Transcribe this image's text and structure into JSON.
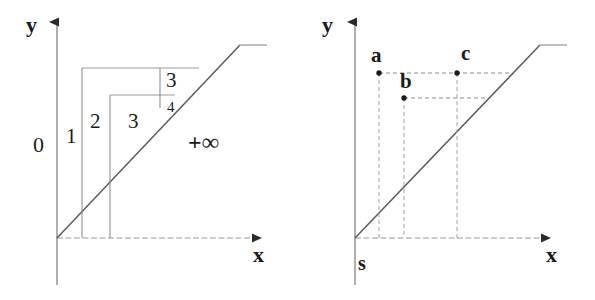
{
  "figure": {
    "title": "",
    "panels": [
      {
        "id": "left",
        "name": "scheduling-region-diagram",
        "axes": {
          "y_label": "y",
          "x_label": "x"
        },
        "labels": [
          {
            "text": "0",
            "x": 33,
            "y": 134,
            "role": "region-index"
          },
          {
            "text": "1",
            "x": 66,
            "y": 126,
            "role": "region-index"
          },
          {
            "text": "2",
            "x": 90,
            "y": 111,
            "role": "region-index"
          },
          {
            "text": "3",
            "x": 128,
            "y": 111,
            "role": "region-index"
          },
          {
            "text": "3",
            "x": 166,
            "y": 70,
            "role": "region-index"
          },
          {
            "text": "4",
            "x": 167,
            "y": 102,
            "role": "region-index-small"
          },
          {
            "text": "+∞",
            "x": 188,
            "y": 131,
            "role": "infinity-marker"
          }
        ],
        "geometry": {
          "origin": [
            57,
            238
          ],
          "y_axis_top": [
            57,
            18
          ],
          "x_axis_end": [
            266,
            238
          ],
          "diagonal": [
            [
              57,
              238
            ],
            [
              240,
              45
            ]
          ],
          "plateau": [
            [
              240,
              45
            ],
            [
              266,
              45
            ]
          ],
          "rect_outer": {
            "x": 82,
            "y": 68,
            "w": 98,
            "h": 170
          },
          "rect_inner": {
            "x": 110,
            "y": 95,
            "w": 52,
            "h": 143
          },
          "divider_vertical_x": 160,
          "divider_top_y": 68,
          "divider_bottom_y": 95
        }
      },
      {
        "id": "right",
        "name": "point-dominance-diagram",
        "axes": {
          "y_label": "y",
          "x_label": "x"
        },
        "labels": [
          {
            "text": "a",
            "x": 370,
            "y": 46,
            "role": "point-name"
          },
          {
            "text": "b",
            "x": 400,
            "y": 72,
            "role": "point-name"
          },
          {
            "text": "c",
            "x": 462,
            "y": 44,
            "role": "point-name"
          },
          {
            "text": "s",
            "x": 358,
            "y": 254,
            "role": "source-name"
          }
        ],
        "points": [
          {
            "name": "a",
            "x": 379,
            "y": 73
          },
          {
            "name": "b",
            "x": 404,
            "y": 98
          },
          {
            "name": "c",
            "x": 457,
            "y": 73
          }
        ],
        "geometry": {
          "origin": [
            355,
            238
          ],
          "y_axis_top": [
            355,
            18
          ],
          "x_axis_end": [
            555,
            238
          ],
          "diagonal": [
            [
              355,
              238
            ],
            [
              540,
              45
            ]
          ],
          "plateau": [
            [
              540,
              45
            ],
            [
              566,
              45
            ]
          ]
        }
      }
    ],
    "colors": {
      "ink": "#2b2b2b",
      "line": "#6e6e6e",
      "dash": "#8a8a8a",
      "background": "#ffffff"
    }
  }
}
